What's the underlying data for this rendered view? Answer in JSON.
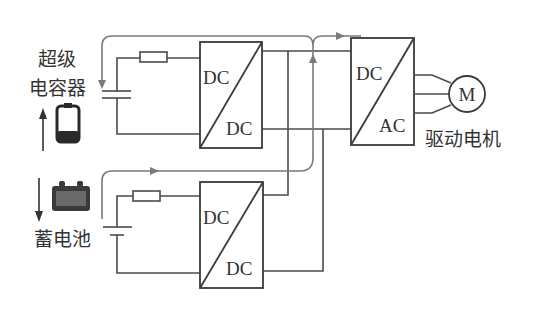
{
  "diagram": {
    "labels": {
      "supercap_line1": "超级",
      "supercap_line2": "电容器",
      "battery": "蓄电池",
      "motor_caption": "驱动电机",
      "motor_symbol": "M"
    },
    "converters": [
      {
        "id": "dcdc-top",
        "input": "DC",
        "output": "DC"
      },
      {
        "id": "dcdc-bottom",
        "input": "DC",
        "output": "DC"
      },
      {
        "id": "dcac",
        "input": "DC",
        "output": "AC"
      }
    ],
    "icons": {
      "supercap": "supercapacitor-cell-icon",
      "battery": "car-battery-icon",
      "charge_arrow": "up-arrow-icon",
      "discharge_arrow": "down-arrow-icon"
    },
    "colors": {
      "line": "#4a4a4a",
      "flow_line": "#7a7a7a",
      "text": "#333333",
      "background": "#ffffff"
    }
  }
}
